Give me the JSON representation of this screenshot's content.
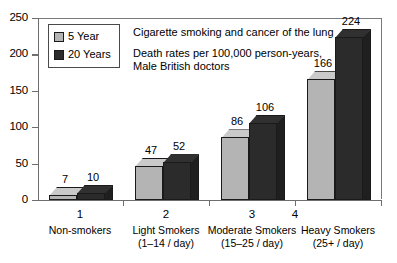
{
  "chart_data": {
    "type": "bar",
    "title": "Cigarette smoking and cancer of the lung",
    "subtitle_line1": "Death rates per 100,000 person-years,",
    "subtitle_line2": "Male British doctors",
    "xlabel": "",
    "ylabel": "",
    "ylim": [
      0,
      250
    ],
    "yticks": [
      0,
      50,
      100,
      150,
      200,
      250
    ],
    "xticks": [
      1,
      2,
      3,
      4
    ],
    "grid": false,
    "legend_position": "top-left",
    "categories": [
      "Non-smokers",
      "Light Smokers",
      "Moderate Smokers",
      "Heavy Smokers"
    ],
    "category_sublabels": [
      "",
      "(1–14 / day)",
      "(15–25 / day)",
      "(25+ / day)"
    ],
    "series": [
      {
        "name": "5 Year",
        "color": "#b4b4b4",
        "values": [
          7,
          47,
          86,
          166
        ]
      },
      {
        "name": "20 Years",
        "color": "#2b2b2b",
        "values": [
          10,
          52,
          106,
          224
        ]
      }
    ]
  },
  "axis": {
    "y_tick_labels": [
      "250",
      "200",
      "150",
      "100",
      "50",
      "0"
    ],
    "x_tick_labels": [
      "1",
      "2",
      "3",
      "4"
    ]
  },
  "legend": {
    "items": [
      {
        "label": "5 Year"
      },
      {
        "label": "20 Years"
      }
    ]
  },
  "values_text": {
    "g0s0": "7",
    "g0s1": "10",
    "g1s0": "47",
    "g1s1": "52",
    "g2s0": "86",
    "g2s1": "106",
    "g3s0": "166",
    "g3s1": "224"
  },
  "categories_text": {
    "c0_line1": "Non-smokers",
    "c0_line2": "",
    "c1_line1": "Light Smokers",
    "c1_line2": "(1–14 / day)",
    "c2_line1": "Moderate Smokers",
    "c2_line2": "(15–25 / day)",
    "c3_line1": "Heavy Smokers",
    "c3_line2": "(25+ / day)"
  },
  "colors": {
    "series_5year": "#b4b4b4",
    "series_20years": "#2b2b2b",
    "axis": "#6e6e6e",
    "background": "#ffffff"
  }
}
